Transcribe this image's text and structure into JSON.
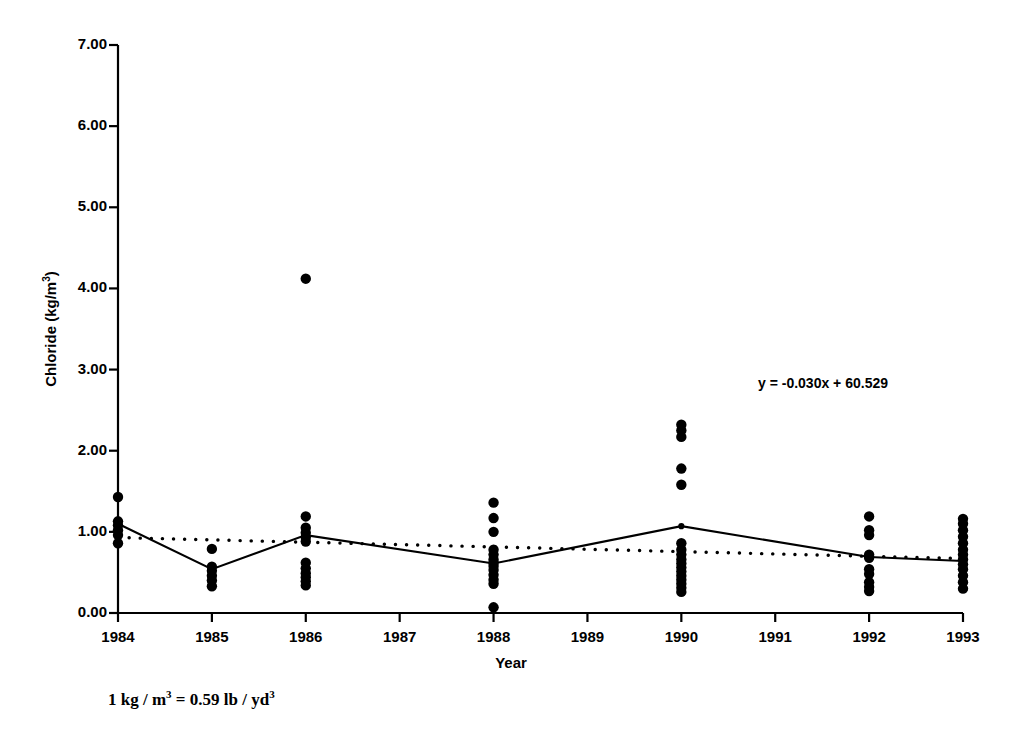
{
  "chart_data": {
    "type": "scatter",
    "title": "",
    "xlabel": "Year",
    "ylabel": "Chloride (kg/m3)",
    "ylabel_html": "Chloride (kg/m<sup>3</sup>)",
    "xlim": [
      1984,
      1993
    ],
    "ylim": [
      0.0,
      7.0
    ],
    "grid": false,
    "legend": "none",
    "x_tick_labels": [
      "1984",
      "1985",
      "1986",
      "1987",
      "1988",
      "1989",
      "1990",
      "1991",
      "1992",
      "1993"
    ],
    "x_ticks": [
      1984,
      1985,
      1986,
      1987,
      1988,
      1989,
      1990,
      1991,
      1992,
      1993
    ],
    "y_tick_labels": [
      "0.00",
      "1.00",
      "2.00",
      "3.00",
      "4.00",
      "5.00",
      "6.00",
      "7.00"
    ],
    "y_ticks": [
      0.0,
      1.0,
      2.0,
      3.0,
      4.0,
      5.0,
      6.0,
      7.0
    ],
    "annotation": "y = -0.030x + 60.529",
    "footnote": "1 kg / m3 = 0.59 lb / yd3",
    "footnote_html": "1 kg / m<sup>3</sup> = 0.59 lb / yd<sup>3</sup>",
    "scatter_points": [
      {
        "year": 1984,
        "values": [
          1.43,
          1.13,
          1.08,
          1.02,
          0.96,
          0.86
        ]
      },
      {
        "year": 1985,
        "values": [
          0.79,
          0.57,
          0.52,
          0.46,
          0.4,
          0.33
        ]
      },
      {
        "year": 1986,
        "values": [
          4.12,
          1.19,
          1.05,
          0.99,
          0.93,
          0.88,
          0.62,
          0.55,
          0.49,
          0.44,
          0.39,
          0.34
        ]
      },
      {
        "year": 1988,
        "values": [
          1.36,
          1.17,
          1.0,
          0.78,
          0.72,
          0.66,
          0.62,
          0.58,
          0.53,
          0.47,
          0.41,
          0.36,
          0.07
        ]
      },
      {
        "year": 1990,
        "values": [
          2.32,
          2.25,
          2.17,
          1.78,
          1.58,
          0.86,
          0.78,
          0.72,
          0.66,
          0.61,
          0.56,
          0.51,
          0.46,
          0.41,
          0.36,
          0.31,
          0.26
        ]
      },
      {
        "year": 1992,
        "values": [
          1.19,
          1.02,
          0.96,
          0.72,
          0.68,
          0.54,
          0.48,
          0.38,
          0.32,
          0.27
        ]
      },
      {
        "year": 1993,
        "values": [
          1.16,
          1.1,
          1.02,
          0.94,
          0.86,
          0.78,
          0.72,
          0.66,
          0.6,
          0.54,
          0.46,
          0.38,
          0.3
        ]
      }
    ],
    "series": [
      {
        "name": "annual mean",
        "style": "solid-line-with-markers",
        "x": [
          1984,
          1985,
          1986,
          1988,
          1990,
          1992,
          1993
        ],
        "values": [
          1.1,
          0.54,
          0.96,
          0.61,
          1.07,
          0.69,
          0.64
        ]
      },
      {
        "name": "linear trend",
        "style": "dotted-line",
        "x": [
          1984,
          1993
        ],
        "values": [
          0.93,
          0.67
        ]
      }
    ],
    "colors": {
      "axis": "#000000",
      "marker": "#000000",
      "mean_line": "#000000",
      "trend_line": "#000000",
      "background": "#ffffff"
    }
  }
}
